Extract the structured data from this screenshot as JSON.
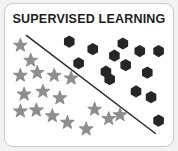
{
  "card": {
    "title": "SUPERVISED LEARNING",
    "background_color": "#ffffff",
    "border_color": "#c9c9c9",
    "outer_background_color": "#f2f2f2"
  },
  "chart_data": {
    "type": "scatter",
    "title": "SUPERVISED LEARNING",
    "xlabel": "",
    "ylabel": "",
    "grid": false,
    "legend_position": "none",
    "xlim": [
      0,
      178
    ],
    "ylim": [
      0,
      151
    ],
    "annotations": [
      {
        "name": "decision-boundary",
        "type": "line",
        "x1": 22,
        "y1": 33,
        "x2": 160,
        "y2": 138,
        "color": "#2a2a2a",
        "width": 1.6
      }
    ],
    "series": [
      {
        "name": "Class A (stars)",
        "marker": "star",
        "color": "#8e8e8e",
        "size": 15,
        "points": [
          {
            "x": 16,
            "y": 44
          },
          {
            "x": 27,
            "y": 60
          },
          {
            "x": 16,
            "y": 76
          },
          {
            "x": 34,
            "y": 73
          },
          {
            "x": 52,
            "y": 76
          },
          {
            "x": 70,
            "y": 79
          },
          {
            "x": 20,
            "y": 96
          },
          {
            "x": 40,
            "y": 93
          },
          {
            "x": 58,
            "y": 100
          },
          {
            "x": 16,
            "y": 114
          },
          {
            "x": 33,
            "y": 113
          },
          {
            "x": 50,
            "y": 119
          },
          {
            "x": 66,
            "y": 126
          },
          {
            "x": 86,
            "y": 133
          },
          {
            "x": 95,
            "y": 112
          },
          {
            "x": 110,
            "y": 122
          },
          {
            "x": 122,
            "y": 118
          }
        ]
      },
      {
        "name": "Class B (hexagons)",
        "marker": "hexagon",
        "color": "#262626",
        "size": 13,
        "points": [
          {
            "x": 68,
            "y": 40
          },
          {
            "x": 93,
            "y": 48
          },
          {
            "x": 125,
            "y": 42
          },
          {
            "x": 143,
            "y": 50
          },
          {
            "x": 163,
            "y": 50
          },
          {
            "x": 78,
            "y": 63
          },
          {
            "x": 116,
            "y": 55
          },
          {
            "x": 128,
            "y": 65
          },
          {
            "x": 107,
            "y": 72
          },
          {
            "x": 151,
            "y": 73
          },
          {
            "x": 111,
            "y": 80
          },
          {
            "x": 139,
            "y": 93
          },
          {
            "x": 155,
            "y": 99
          },
          {
            "x": 163,
            "y": 124
          }
        ]
      }
    ]
  }
}
